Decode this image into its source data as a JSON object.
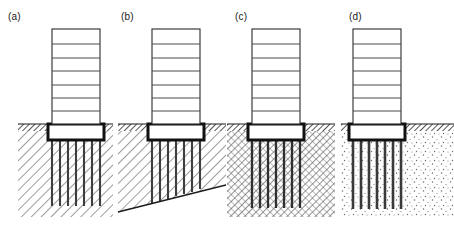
{
  "figure": {
    "panel_count": 4,
    "background_color": "#ffffff",
    "line_color": "#1a1a1a",
    "pile_color": "#4d4d4d",
    "cap_color": "#111111",
    "image_width": 454,
    "image_height": 239
  },
  "panels": [
    {
      "label": "(a)",
      "name": "panel-a",
      "soil_pattern": "diagonal-hatch",
      "soil_description": "uniform firm stratum, single-direction diagonal hatching",
      "pile_layout": "uniform-length-vertical",
      "pile_count": 7,
      "pile_tip_level": "uniform",
      "bearing_surface": "horizontal",
      "topsoil_band": "dense-cross-hatch",
      "building_stories": 7,
      "floor_lines": 6
    },
    {
      "label": "(b)",
      "name": "panel-b",
      "soil_pattern": "diagonal-hatch",
      "soil_description": "sloping bearing stratum, piles of graded length",
      "pile_layout": "graded-length-vertical",
      "pile_count": 7,
      "pile_tip_level": "inclined",
      "bearing_surface": "sloping",
      "topsoil_band": "dense-cross-hatch",
      "building_stories": 7,
      "floor_lines": 6
    },
    {
      "label": "(c)",
      "name": "panel-c",
      "soil_pattern": "dense-cross-hatch",
      "soil_description": "stiff cohesive stratum, dense cross hatching",
      "pile_layout": "uniform-length-vertical",
      "pile_count": 7,
      "pile_tip_level": "uniform",
      "bearing_surface": "horizontal",
      "topsoil_band": "dense-cross-hatch",
      "building_stories": 7,
      "floor_lines": 6
    },
    {
      "label": "(d)",
      "name": "panel-d",
      "soil_pattern": "stipple",
      "soil_description": "granular sand stratum, stippled dot fill",
      "pile_layout": "uniform-length-vertical",
      "pile_count": 7,
      "pile_tip_level": "uniform",
      "bearing_surface": "horizontal",
      "topsoil_band": "dense-cross-hatch",
      "building_stories": 7,
      "floor_lines": 6
    }
  ]
}
